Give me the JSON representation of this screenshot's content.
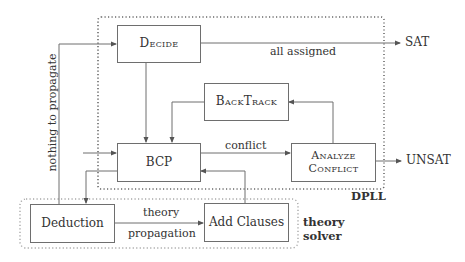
{
  "diagram": {
    "groups": {
      "dpll": {
        "label": "DPLL"
      },
      "theory_solver": {
        "label_line1": "theory",
        "label_line2": "solver"
      }
    },
    "nodes": {
      "decide": {
        "label": "Decide"
      },
      "backtrack": {
        "label": "BackTrack"
      },
      "bcp": {
        "label": "BCP"
      },
      "analyze_conflict": {
        "label_line1": "Analyze",
        "label_line2": "Conflict"
      },
      "deduction": {
        "label": "Deduction"
      },
      "add_clauses": {
        "label": "Add Clauses"
      }
    },
    "outputs": {
      "sat": "SAT",
      "unsat": "UNSAT"
    },
    "edges": [
      {
        "from": "decide",
        "to": "sat",
        "label": "all assigned"
      },
      {
        "from": "decide",
        "to": "bcp",
        "label": ""
      },
      {
        "from": "backtrack",
        "to": "bcp",
        "label": ""
      },
      {
        "from": "bcp",
        "to": "analyze_conflict",
        "label": "conflict"
      },
      {
        "from": "analyze_conflict",
        "to": "backtrack",
        "label": ""
      },
      {
        "from": "analyze_conflict",
        "to": "unsat",
        "label": ""
      },
      {
        "from": "bcp",
        "to": "deduction",
        "label": ""
      },
      {
        "from": "deduction",
        "to": "decide",
        "label": "nothing to propagate"
      },
      {
        "from": "deduction",
        "to": "add_clauses",
        "label_line1": "theory",
        "label_line2": "propagation"
      },
      {
        "from": "add_clauses",
        "to": "bcp",
        "label": ""
      },
      {
        "from": "external",
        "to": "bcp",
        "label": ""
      }
    ],
    "edge_labels": {
      "all_assigned": "all assigned",
      "conflict": "conflict",
      "nothing_to_propagate": "nothing to propagate",
      "theory": "theory",
      "propagation": "propagation"
    },
    "colors": {
      "line": "#6e6e6e",
      "dpll_border": "#6a6a6a",
      "theory_border": "#a8a8a8",
      "text": "#333333"
    }
  }
}
